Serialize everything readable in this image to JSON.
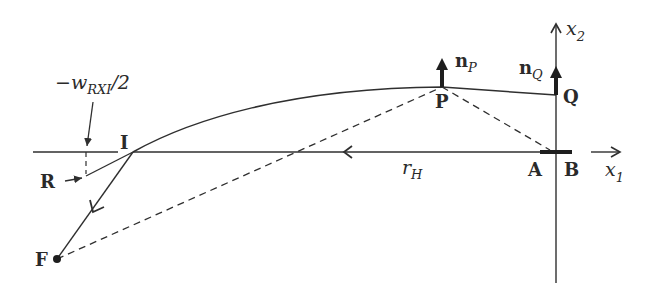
{
  "diagram": {
    "colors": {
      "stroke": "#2f2f2f",
      "background": "#ffffff"
    },
    "labels": {
      "width_label_prefix": "−w",
      "width_label_sub": "RXI",
      "width_label_suffix": "/2",
      "I": "I",
      "R": "R",
      "F": "F",
      "P": "P",
      "Q": "Q",
      "A": "A",
      "B": "B",
      "nP_main": "n",
      "nP_sub": "P",
      "nQ_main": "n",
      "nQ_sub": "Q",
      "rH_main": "r",
      "rH_sub": "H",
      "x1_main": "x",
      "x1_sub": "1",
      "x2_main": "x",
      "x2_sub": "2"
    }
  }
}
